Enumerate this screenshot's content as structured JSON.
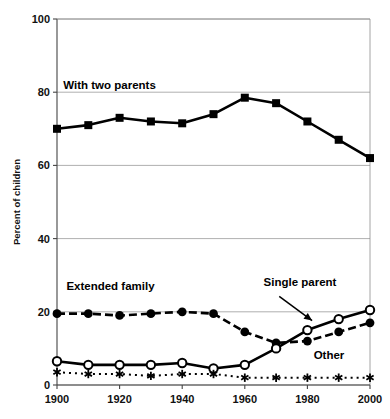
{
  "chart_data": {
    "type": "line",
    "title": "",
    "xlabel": "",
    "ylabel": "Percent of children",
    "xlim": [
      1900,
      2000
    ],
    "ylim": [
      0,
      100
    ],
    "grid": true,
    "legend_position": "inline-annotations",
    "x": [
      1900,
      1910,
      1920,
      1930,
      1940,
      1950,
      1960,
      1970,
      1980,
      1990,
      2000
    ],
    "xticks": [
      1900,
      1920,
      1940,
      1960,
      1980,
      2000
    ],
    "xticklabels": [
      "1900",
      "1920",
      "1940",
      "1960",
      "1980",
      "2000"
    ],
    "yticks": [
      0,
      20,
      40,
      60,
      80,
      100
    ],
    "yticklabels": [
      "0",
      "20",
      "40",
      "60",
      "80",
      "100"
    ],
    "series": [
      {
        "name": "With two parents",
        "marker": "filled-square",
        "line": "solid",
        "values": [
          70,
          71,
          73,
          72,
          71.5,
          74,
          78.5,
          77,
          72,
          67,
          62
        ]
      },
      {
        "name": "Extended family",
        "marker": "filled-circle",
        "line": "dashed",
        "values": [
          19.5,
          19.5,
          19,
          19.5,
          20,
          19.5,
          14.5,
          11.5,
          12,
          14.5,
          17
        ]
      },
      {
        "name": "Single parent",
        "marker": "open-circle",
        "line": "solid",
        "values": [
          6.5,
          5.5,
          5.5,
          5.5,
          6,
          4.5,
          5.5,
          10,
          15,
          18,
          20.5
        ]
      },
      {
        "name": "Other",
        "marker": "asterisk",
        "line": "dotted",
        "values": [
          3.5,
          3,
          3,
          2.5,
          3,
          3,
          2,
          2,
          2,
          2,
          2
        ]
      }
    ],
    "annotations": [
      {
        "text": "With two parents",
        "x": 1902,
        "y": 81
      },
      {
        "text": "Extended family",
        "x": 1903,
        "y": 26
      },
      {
        "text": "Single parent",
        "x": 1966,
        "y": 27
      },
      {
        "text": "Other",
        "x": 1982,
        "y": 7
      }
    ]
  }
}
